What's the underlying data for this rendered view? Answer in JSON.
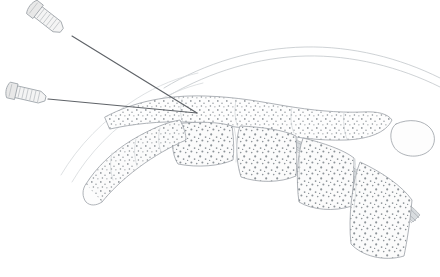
{
  "figure": {
    "title": "Two-needle spinal injection, sagittal lumbar section",
    "background_color": "#ffffff",
    "line_color": "#9aa0a6",
    "needle_color": "#5f6368",
    "stipple_color": "#8d9398",
    "cord_shade_color": "#d8dcdf",
    "width": 440,
    "height": 277
  },
  "needles": [
    {
      "id": "needle-upper",
      "label": "Upper spinal needle",
      "hub_center": [
        46,
        18
      ],
      "hub_angle_deg": 38,
      "hub_length": 34,
      "hub_width": 13,
      "rib_count": 6,
      "shaft_start": [
        72,
        36
      ],
      "shaft_end": [
        197,
        113
      ]
    },
    {
      "id": "needle-lower",
      "label": "Lower spinal needle",
      "hub_center": [
        26,
        94
      ],
      "hub_angle_deg": 13,
      "hub_length": 34,
      "hub_width": 12,
      "rib_count": 6,
      "shaft_start": [
        48,
        99
      ],
      "shaft_end": [
        197,
        113
      ]
    }
  ],
  "convergence_point": [
    197,
    113
  ],
  "anatomy": {
    "skin_arcs": [
      {
        "id": "skin-outer",
        "label": "Skin outer contour"
      },
      {
        "id": "skin-inner",
        "label": "Subcutaneous contour"
      },
      {
        "id": "fascia-left-upper",
        "label": "Left fascial plane upper"
      },
      {
        "id": "fascia-left-lower",
        "label": "Left fascial plane lower"
      }
    ],
    "spinous_band": {
      "id": "spinous-processes",
      "label": "Spinous process band",
      "stippled": true
    },
    "vertebral_bodies": [
      {
        "id": "vertebra-1",
        "label": "Lumbar vertebral body 1",
        "stippled": true
      },
      {
        "id": "vertebra-2",
        "label": "Lumbar vertebral body 2",
        "stippled": true
      },
      {
        "id": "vertebra-3",
        "label": "Lumbar vertebral body 3",
        "stippled": true
      },
      {
        "id": "vertebra-4",
        "label": "Lumbar vertebral body 4",
        "stippled": true
      },
      {
        "id": "vertebra-5",
        "label": "Sacral segment",
        "stippled": true
      }
    ],
    "facet_chain": {
      "id": "facet-processes",
      "label": "Articular process chain",
      "stippled": true
    },
    "spinal_cord": {
      "id": "spinal-cord-band",
      "label": "Spinal canal contents / dural sac",
      "shaded": true
    },
    "coccyx_lobe": {
      "id": "coccyx-lobe",
      "label": "Coccygeal segment"
    }
  }
}
